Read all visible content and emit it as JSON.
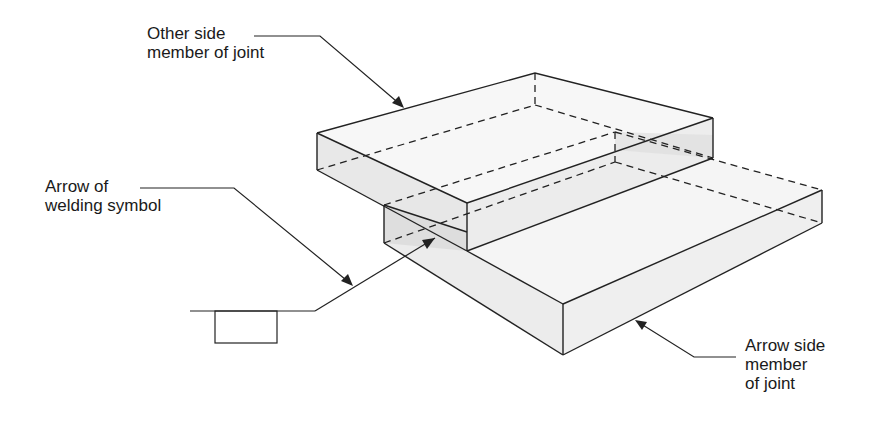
{
  "diagram": {
    "labels": {
      "other_side": "Other side\nmember of joint",
      "arrow_of_symbol": "Arrow of\nwelding symbol",
      "arrow_side": "Arrow side\nmember\nof joint"
    },
    "colors": {
      "line": "#222222",
      "face_top": "#f4f4f4",
      "face_side": "#e6e6e6",
      "face_shadow": "#d9d9d9",
      "background": "#ffffff"
    }
  }
}
